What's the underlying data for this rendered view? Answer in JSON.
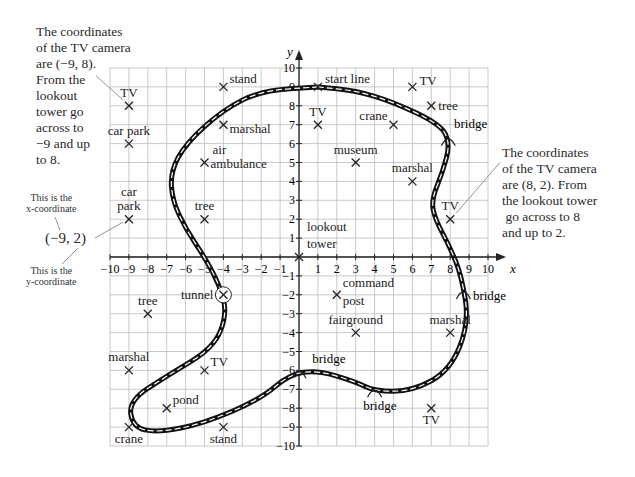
{
  "notes": {
    "left": [
      "The coordinates",
      "of the TV camera",
      "are (−9, 8).",
      "From the",
      "lookout",
      "tower go",
      "across to",
      "−9 and up",
      "to 8."
    ],
    "right": [
      "The coordinates",
      "of the TV camera",
      "are (8, 2). From",
      "the lookout tower",
      " go across to 8",
      "and up to 2."
    ],
    "xcoord_label": [
      "This is the",
      "x-coordinate"
    ],
    "ycoord_label": [
      "This is the",
      "y-coordinate"
    ],
    "coord_example": "(−9, 2)"
  },
  "chart_data": {
    "type": "scatter",
    "title": "",
    "xlabel": "x",
    "ylabel": "y",
    "xlim": [
      -10,
      10
    ],
    "ylim": [
      -10,
      10
    ],
    "grid": true,
    "points": [
      {
        "label": "TV",
        "x": -9,
        "y": 8
      },
      {
        "label": "car park",
        "x": -9,
        "y": 6
      },
      {
        "label": "car park",
        "x": -9,
        "y": 2
      },
      {
        "label": "stand",
        "x": -4,
        "y": 9
      },
      {
        "label": "marshal",
        "x": -4,
        "y": 7
      },
      {
        "label": "air ambulance",
        "x": -5,
        "y": 5
      },
      {
        "label": "tree",
        "x": -5,
        "y": 2
      },
      {
        "label": "start line",
        "x": 1,
        "y": 9
      },
      {
        "label": "TV",
        "x": 1,
        "y": 7
      },
      {
        "label": "TV",
        "x": 6,
        "y": 9
      },
      {
        "label": "tree",
        "x": 7,
        "y": 8
      },
      {
        "label": "crane",
        "x": 5,
        "y": 7
      },
      {
        "label": "museum",
        "x": 3,
        "y": 5
      },
      {
        "label": "marshal",
        "x": 6,
        "y": 4
      },
      {
        "label": "TV",
        "x": 8,
        "y": 2
      },
      {
        "label": "lookout tower",
        "x": 0,
        "y": 0
      },
      {
        "label": "tree",
        "x": -8,
        "y": -3
      },
      {
        "label": "tunnel",
        "x": -4,
        "y": -2
      },
      {
        "label": "command post",
        "x": 2,
        "y": -2
      },
      {
        "label": "fairground",
        "x": 3,
        "y": -4
      },
      {
        "label": "marshal",
        "x": 8,
        "y": -4
      },
      {
        "label": "marshal",
        "x": -9,
        "y": -6
      },
      {
        "label": "TV",
        "x": -5,
        "y": -6
      },
      {
        "label": "pond",
        "x": -7,
        "y": -8
      },
      {
        "label": "crane",
        "x": -9,
        "y": -9
      },
      {
        "label": "stand",
        "x": -4,
        "y": -9
      },
      {
        "label": "TV",
        "x": 7,
        "y": -8
      }
    ],
    "annotations": [
      "bridge",
      "bridge",
      "bridge",
      "bridge"
    ]
  }
}
